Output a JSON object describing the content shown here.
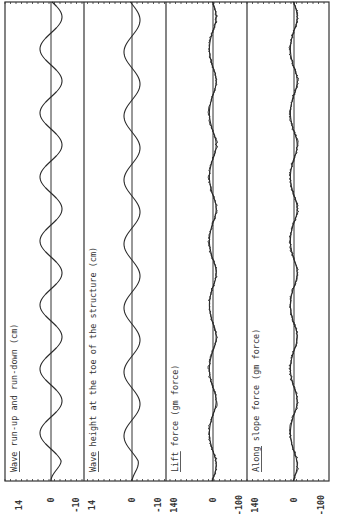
{
  "chart_data": {
    "type": "line",
    "orientation": "rotated-90-ccw",
    "title": "",
    "xlabel": "Time",
    "panels": [
      {
        "label": "Wave run-up and run-down (cm)",
        "yticks": [
          "14",
          "0",
          "-10"
        ],
        "ylim": [
          -10,
          14
        ],
        "series": [
          {
            "name": "run-up/run-down",
            "style": "smooth",
            "amplitude": 4.5,
            "cycles": 7.5
          }
        ]
      },
      {
        "label": "Wave height at the toe of the structure (cm)",
        "yticks": [
          "14",
          "0",
          "-10"
        ],
        "ylim": [
          -10,
          14
        ],
        "series": [
          {
            "name": "wave height",
            "style": "smooth",
            "amplitude": 3.5,
            "cycles": 7.5
          }
        ]
      },
      {
        "label": "Lift force (gm force)",
        "yticks": [
          "140",
          "0",
          "-100"
        ],
        "ylim": [
          -100,
          140
        ],
        "series": [
          {
            "name": "measured",
            "style": "noisy",
            "amplitude": 12,
            "cycles": 7.5
          },
          {
            "name": "computed",
            "style": "smooth",
            "amplitude": 10,
            "cycles": 7.5
          }
        ]
      },
      {
        "label": "Along slope force (gm force)",
        "yticks": [
          "140",
          "0",
          "-100"
        ],
        "ylim": [
          -100,
          140
        ],
        "series": [
          {
            "name": "measured",
            "style": "noisy",
            "amplitude": 11,
            "cycles": 7.5
          },
          {
            "name": "computed",
            "style": "smooth",
            "amplitude": 9,
            "cycles": 7.5
          }
        ]
      }
    ],
    "grid": false,
    "legend": "none"
  },
  "colors": {
    "line": "#2a2a2a",
    "frame": "#333333",
    "background": "#ffffff"
  }
}
